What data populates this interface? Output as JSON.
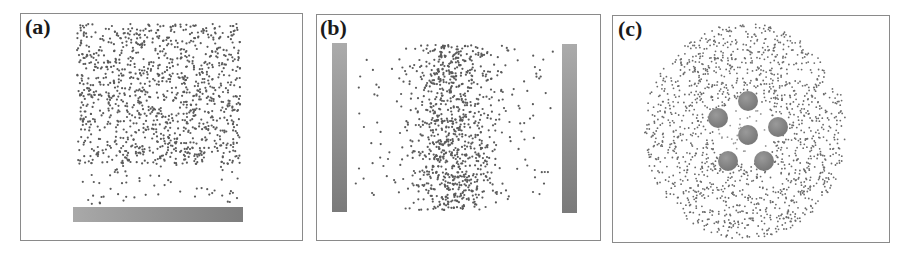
{
  "figure": {
    "panels": [
      {
        "id": "a",
        "label": "(a)",
        "description": "Particles settling above a horizontal bottom electrode plate",
        "frame": {
          "x": 20,
          "y": 13,
          "w": 283,
          "h": 228
        },
        "label_pos": {
          "x": 25,
          "y": 16
        },
        "plates": [
          {
            "orientation": "horizontal",
            "x": 73,
            "y": 207,
            "w": 170,
            "h": 15
          }
        ],
        "particles": {
          "color": "#5a5a5a",
          "dense_region": {
            "x": 77,
            "y": 24,
            "w": 163,
            "h": 140,
            "count": 1150
          },
          "sparse_region": {
            "x": 80,
            "y": 160,
            "w": 158,
            "h": 45,
            "count": 60
          },
          "radius": 1.1,
          "seed": 11
        }
      },
      {
        "id": "b",
        "label": "(b)",
        "description": "Particles dispersed between two vertical electrode plates",
        "frame": {
          "x": 316,
          "y": 14,
          "w": 285,
          "h": 227
        },
        "label_pos": {
          "x": 320,
          "y": 17
        },
        "plates": [
          {
            "orientation": "vertical",
            "x": 332,
            "y": 43,
            "w": 15,
            "h": 169
          },
          {
            "orientation": "vertical",
            "x": 562,
            "y": 44,
            "w": 15,
            "h": 169
          }
        ],
        "particles": {
          "color": "#5a5a5a",
          "dense_region": {
            "x": 392,
            "y": 45,
            "w": 125,
            "h": 165,
            "count": 850
          },
          "sparse_region": {
            "x": 355,
            "y": 48,
            "w": 198,
            "h": 150,
            "count": 160
          },
          "radius": 1.1,
          "seed": 23
        }
      },
      {
        "id": "c",
        "label": "(c)",
        "description": "Ring of particles around a hexagonal cluster of spherical electrodes",
        "frame": {
          "x": 612,
          "y": 15,
          "w": 278,
          "h": 228
        },
        "label_pos": {
          "x": 618,
          "y": 18
        },
        "spheres": [
          {
            "cx": 748,
            "cy": 101,
            "r": 10
          },
          {
            "cx": 718,
            "cy": 118,
            "r": 10
          },
          {
            "cx": 778,
            "cy": 127,
            "r": 10
          },
          {
            "cx": 748,
            "cy": 135,
            "r": 10
          },
          {
            "cx": 728,
            "cy": 161,
            "r": 10
          },
          {
            "cx": 764,
            "cy": 161,
            "r": 10
          }
        ],
        "particles": {
          "color": "#6a6a6a",
          "annulus": {
            "cx": 745,
            "cy": 131,
            "r_inner": 30,
            "r_outer": 100,
            "count": 1500
          },
          "radius": 0.9,
          "seed": 37
        }
      }
    ]
  }
}
